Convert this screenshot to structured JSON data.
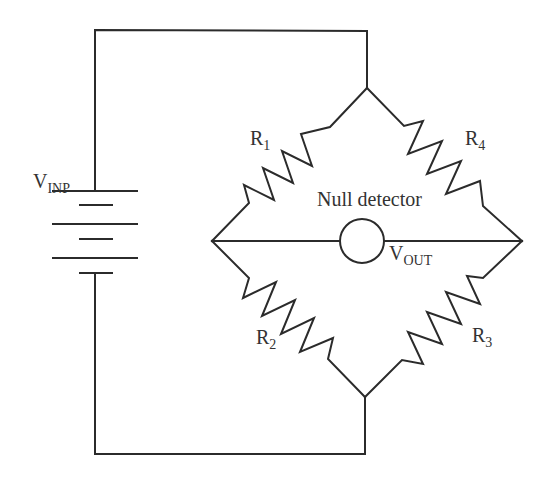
{
  "diagram": {
    "type": "circuit-schematic",
    "colors": {
      "stroke": "#2b2b2b",
      "text": "#333333",
      "background": "#ffffff"
    },
    "source": {
      "label_main": "V",
      "label_sub": "INP",
      "component": "battery"
    },
    "detector": {
      "label": "Null detector",
      "output_main": "V",
      "output_sub": "OUT",
      "component": "meter-circle"
    },
    "resistors": [
      {
        "id": "R1",
        "label_main": "R",
        "label_sub": "1",
        "position": "upper-left"
      },
      {
        "id": "R4",
        "label_main": "R",
        "label_sub": "4",
        "position": "upper-right"
      },
      {
        "id": "R2",
        "label_main": "R",
        "label_sub": "2",
        "position": "lower-left"
      },
      {
        "id": "R3",
        "label_main": "R",
        "label_sub": "3",
        "position": "lower-right"
      }
    ],
    "nodes": {
      "top": [
        367,
        88
      ],
      "left": [
        212,
        241
      ],
      "right": [
        522,
        241
      ],
      "bottom": [
        365,
        397
      ]
    }
  }
}
